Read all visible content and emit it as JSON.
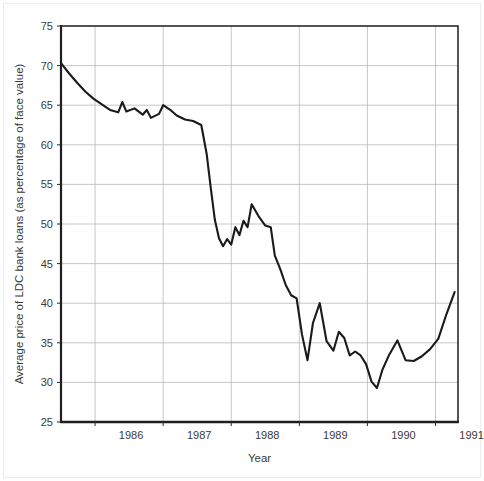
{
  "chart_data": {
    "type": "line",
    "title": "",
    "xlabel": "Year",
    "ylabel": "Average price of LDC bank loans (as percentage of face value)",
    "xlim": [
      1985.5,
      1991.33
    ],
    "ylim": [
      25,
      75
    ],
    "grid": true,
    "legend": "none",
    "x_tick_labels": [
      "1986",
      "1987",
      "1988",
      "1989",
      "1990",
      "1991"
    ],
    "x_tick_values": [
      1986,
      1987,
      1988,
      1989,
      1990,
      1991
    ],
    "y_tick_labels": [
      "25",
      "30",
      "35",
      "40",
      "45",
      "50",
      "55",
      "60",
      "65",
      "70",
      "75"
    ],
    "y_tick_values": [
      25,
      30,
      35,
      40,
      45,
      50,
      55,
      60,
      65,
      70,
      75
    ],
    "series": [
      {
        "name": "Average price of LDC bank loans",
        "color": "#1a1a1a",
        "x": [
          1985.5,
          1985.62,
          1985.74,
          1985.86,
          1985.98,
          1986.1,
          1986.22,
          1986.34,
          1986.4,
          1986.46,
          1986.58,
          1986.7,
          1986.76,
          1986.82,
          1986.94,
          1987.0,
          1987.12,
          1987.2,
          1987.32,
          1987.44,
          1987.56,
          1987.64,
          1987.7,
          1987.76,
          1987.82,
          1987.88,
          1987.94,
          1988.0,
          1988.06,
          1988.12,
          1988.18,
          1988.24,
          1988.3,
          1988.4,
          1988.5,
          1988.58,
          1988.64,
          1988.72,
          1988.8,
          1988.88,
          1988.96,
          1989.04,
          1989.12,
          1989.2,
          1989.3,
          1989.4,
          1989.5,
          1989.58,
          1989.66,
          1989.74,
          1989.82,
          1989.9,
          1989.98,
          1990.06,
          1990.14,
          1990.22,
          1990.32,
          1990.44,
          1990.56,
          1990.68,
          1990.8,
          1990.92,
          1991.04,
          1991.16,
          1991.28
        ],
        "y": [
          70.3,
          69.0,
          67.8,
          66.7,
          65.8,
          65.1,
          64.4,
          64.1,
          65.4,
          64.2,
          64.6,
          63.8,
          64.4,
          63.4,
          63.9,
          65.0,
          64.3,
          63.7,
          63.2,
          63.0,
          62.5,
          58.8,
          54.5,
          50.5,
          48.2,
          47.2,
          48.1,
          47.4,
          49.6,
          48.6,
          50.4,
          49.6,
          52.5,
          51.0,
          49.8,
          49.6,
          46.0,
          44.3,
          42.3,
          41.0,
          40.6,
          36.0,
          32.8,
          37.5,
          40.0,
          35.2,
          34.0,
          36.4,
          35.6,
          33.4,
          33.9,
          33.4,
          32.3,
          30.1,
          29.3,
          31.6,
          33.5,
          35.3,
          32.8,
          32.7,
          33.3,
          34.2,
          35.5,
          38.6,
          41.4
        ]
      }
    ],
    "notes": {
      "first_value": 70.3,
      "last_value": 41.4,
      "max_value": 70.3,
      "min_value": 29.3
    }
  },
  "axes": {
    "x_axis_title": "Year",
    "y_axis_title": "Average price of LDC bank loans (as percentage of face value)"
  },
  "style": {
    "line_color": "#1a1a1a",
    "grid_color": "#b9b9b9",
    "axis_color": "#2b2b2b",
    "text_color": "#3a3a3a",
    "plot_background": "#ffffff",
    "figure_background": "#ffffff"
  }
}
